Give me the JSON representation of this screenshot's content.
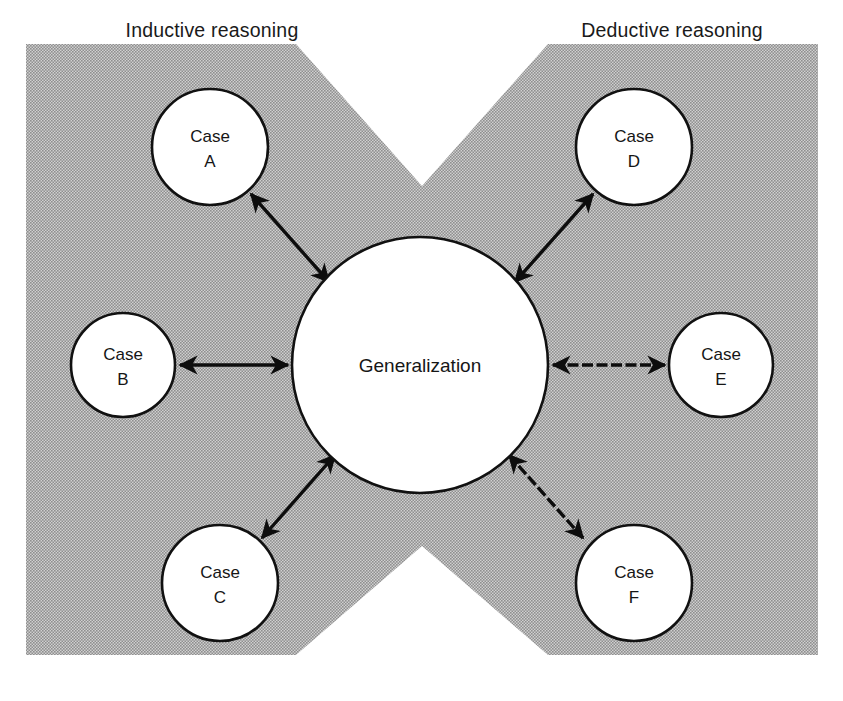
{
  "figure": {
    "type": "concept-diagram",
    "title": "",
    "background_color": "#ffffff",
    "band_color": "#a8a8a8",
    "stroke_color": "#111111"
  },
  "headers": {
    "left": "Inductive reasoning",
    "right": "Deductive reasoning"
  },
  "center": {
    "label": "Generalization",
    "cx": 420,
    "cy": 365,
    "r": 128
  },
  "nodes": [
    {
      "id": "case-a",
      "line1": "Case",
      "line2": "A",
      "cx": 210,
      "cy": 147,
      "r": 58,
      "side": "inductive"
    },
    {
      "id": "case-b",
      "line1": "Case",
      "line2": "B",
      "cx": 123,
      "cy": 365,
      "r": 52,
      "side": "inductive"
    },
    {
      "id": "case-c",
      "line1": "Case",
      "line2": "C",
      "cx": 220,
      "cy": 583,
      "r": 58,
      "side": "inductive"
    },
    {
      "id": "case-d",
      "line1": "Case",
      "line2": "D",
      "cx": 634,
      "cy": 147,
      "r": 58,
      "side": "deductive"
    },
    {
      "id": "case-e",
      "line1": "Case",
      "line2": "E",
      "cx": 721,
      "cy": 365,
      "r": 52,
      "side": "deductive"
    },
    {
      "id": "case-f",
      "line1": "Case",
      "line2": "F",
      "cx": 634,
      "cy": 583,
      "r": 58,
      "side": "deductive"
    }
  ],
  "connectors": [
    {
      "id": "conn-a",
      "from": "case-a",
      "to": "center",
      "style": "solid",
      "arrows": "both"
    },
    {
      "id": "conn-b",
      "from": "case-b",
      "to": "center",
      "style": "solid",
      "arrows": "both"
    },
    {
      "id": "conn-c",
      "from": "case-c",
      "to": "center",
      "style": "solid",
      "arrows": "both"
    },
    {
      "id": "conn-d",
      "from": "center",
      "to": "case-d",
      "style": "solid",
      "arrows": "both"
    },
    {
      "id": "conn-e",
      "from": "center",
      "to": "case-e",
      "style": "dashed",
      "arrows": "both"
    },
    {
      "id": "conn-f",
      "from": "center",
      "to": "case-f",
      "style": "dashed",
      "arrows": "both"
    }
  ],
  "band_shape": {
    "description": "gray hourglass band with V notch at top and inverted-V notch at bottom",
    "points": "26,44 818,44 818,655 26,655",
    "notch_top_apex_y": 186,
    "notch_bottom_apex_y": 546,
    "notch_apex_x": 422
  }
}
